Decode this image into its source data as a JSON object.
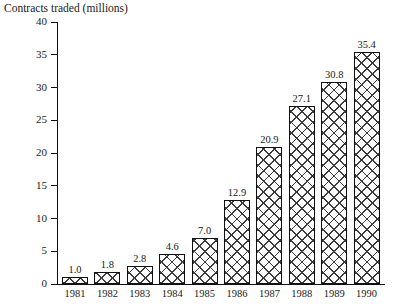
{
  "chart_data": {
    "type": "bar",
    "title": "Contracts traded (millions)",
    "xlabel": "",
    "ylabel": "",
    "categories": [
      "1981",
      "1982",
      "1983",
      "1984",
      "1985",
      "1986",
      "1987",
      "1988",
      "1989",
      "1990"
    ],
    "values": [
      1.0,
      1.8,
      2.8,
      4.6,
      7.0,
      12.9,
      20.9,
      27.1,
      30.8,
      35.4
    ],
    "value_labels": [
      "1.0",
      "1.8",
      "2.8",
      "4.6",
      "7.0",
      "12.9",
      "20.9",
      "27.1",
      "30.8",
      "35.4"
    ],
    "ylim": [
      0,
      40
    ],
    "y_ticks": [
      0,
      5,
      10,
      15,
      20,
      25,
      30,
      35,
      40
    ],
    "y_tick_labels": [
      "0",
      "5",
      "10",
      "15",
      "20",
      "25",
      "30",
      "35",
      "40"
    ],
    "grid": false,
    "legend": null,
    "bar_fill": "crosshatch",
    "bar_outline_color": "#111111",
    "hatch_color": "#3b3b3b",
    "background_color": "#ffffff"
  }
}
